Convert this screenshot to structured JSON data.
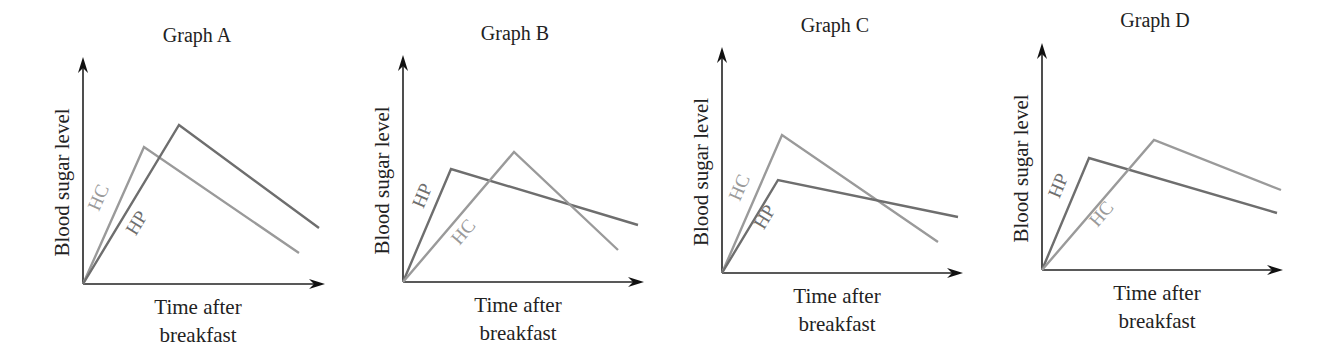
{
  "colors": {
    "HC": "#9a9a9a",
    "HP": "#6e6e6e",
    "axis": "#222222"
  },
  "chart_data": [
    {
      "type": "line",
      "title": "Graph A",
      "xlabel": "Time after breakfast",
      "ylabel": "Blood sugar level",
      "xlabel_lines": [
        "Time after",
        "breakfast"
      ],
      "grid": false,
      "frame": {
        "origin": [
          83,
          284
        ],
        "y_top": 57,
        "x_right": 325,
        "title_pos": [
          197,
          42
        ]
      },
      "series": [
        {
          "name": "HC",
          "points": [
            [
              83,
              284
            ],
            [
              144,
              147
            ],
            [
              299,
              253
            ]
          ],
          "label_pos": [
            104,
            200
          ],
          "description": "rises quickly to an earlier, lower peak then declines"
        },
        {
          "name": "HP",
          "points": [
            [
              83,
              284
            ],
            [
              179,
              125
            ],
            [
              319,
              228
            ]
          ],
          "label_pos": [
            142,
            226
          ],
          "description": "rises to a later, higher peak then declines"
        }
      ]
    },
    {
      "type": "line",
      "title": "Graph B",
      "xlabel": "Time after breakfast",
      "ylabel": "Blood sugar level",
      "xlabel_lines": [
        "Time after",
        "breakfast"
      ],
      "grid": false,
      "frame": {
        "origin": [
          403,
          282
        ],
        "y_top": 55,
        "x_right": 644,
        "title_pos": [
          515,
          40
        ]
      },
      "series": [
        {
          "name": "HP",
          "points": [
            [
              403,
              282
            ],
            [
              451,
              169
            ],
            [
              638,
              225
            ]
          ],
          "label_pos": [
            428,
            198
          ],
          "description": "rises quickly to an early, lower peak then declines slowly"
        },
        {
          "name": "HC",
          "points": [
            [
              403,
              282
            ],
            [
              514,
              152
            ],
            [
              618,
              250
            ]
          ],
          "label_pos": [
            468,
            236
          ],
          "description": "rises to a later, higher peak then declines quickly"
        }
      ]
    },
    {
      "type": "line",
      "title": "Graph C",
      "xlabel": "Time after breakfast",
      "ylabel": "Blood sugar level",
      "xlabel_lines": [
        "Time after",
        "breakfast"
      ],
      "grid": false,
      "frame": {
        "origin": [
          722,
          273
        ],
        "y_top": 47,
        "x_right": 963,
        "title_pos": [
          835,
          32
        ]
      },
      "series": [
        {
          "name": "HC",
          "points": [
            [
              722,
              273
            ],
            [
              782,
              135
            ],
            [
              938,
              242
            ]
          ],
          "label_pos": [
            745,
            190
          ],
          "description": "rises to a higher peak then declines quickly"
        },
        {
          "name": "HP",
          "points": [
            [
              722,
              273
            ],
            [
              778,
              180
            ],
            [
              958,
              217
            ]
          ],
          "label_pos": [
            770,
            220
          ],
          "description": "rises to a lower peak at about the same time then declines slowly"
        }
      ]
    },
    {
      "type": "line",
      "title": "Graph D",
      "xlabel": "Time after breakfast",
      "ylabel": "Blood sugar level",
      "xlabel_lines": [
        "Time after",
        "breakfast"
      ],
      "grid": false,
      "frame": {
        "origin": [
          1042,
          270
        ],
        "y_top": 43,
        "x_right": 1283,
        "title_pos": [
          1155,
          27
        ]
      },
      "series": [
        {
          "name": "HP",
          "points": [
            [
              1042,
              270
            ],
            [
              1089,
              158
            ],
            [
              1277,
              213
            ]
          ],
          "label_pos": [
            1064,
            188
          ],
          "description": "rises quickly to an early, lower peak then declines slowly"
        },
        {
          "name": "HC",
          "points": [
            [
              1042,
              270
            ],
            [
              1154,
              140
            ],
            [
              1281,
              190
            ]
          ],
          "label_pos": [
            1106,
            218
          ],
          "description": "rises to a later, higher peak then declines slowly"
        }
      ]
    }
  ]
}
